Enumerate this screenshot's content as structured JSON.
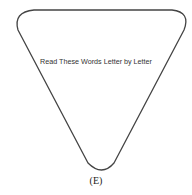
{
  "figure": {
    "shape": "rounded-inverted-triangle",
    "stroke_color": "#444444",
    "text": "Read These Words Letter by Letter",
    "caption": "(E)"
  }
}
